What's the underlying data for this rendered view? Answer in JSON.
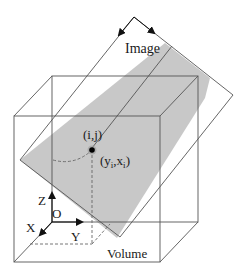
{
  "diagram": {
    "title_label": "Image",
    "pixel_label": "(i,j)",
    "point_label_main": "(y",
    "point_label_sub1": "i",
    "point_label_mid": ",x",
    "point_label_sub2": "i",
    "point_label_end": ")",
    "volume_label": "Volume",
    "axis_labels": {
      "x": "X",
      "y": "Y",
      "z": "Z",
      "origin": "O"
    },
    "colors": {
      "line": "#555555",
      "plane_fill": "#c8c8c8",
      "axis": "#111111",
      "dashed": "#666666",
      "point": "#000000"
    }
  }
}
